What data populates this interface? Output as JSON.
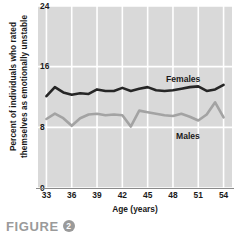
{
  "figure": {
    "caption_word": "FIGURE",
    "caption_number": "2"
  },
  "chart_data": {
    "type": "line",
    "title": "",
    "xlabel": "Age (years)",
    "ylabel": "Percent of individuals who rated\nthemselves as emotionally unstable",
    "xlim": [
      32,
      55
    ],
    "ylim": [
      0,
      24
    ],
    "yticks": [
      0,
      8,
      16,
      24
    ],
    "xticks": [
      33,
      36,
      39,
      42,
      45,
      48,
      51,
      54
    ],
    "grid": true,
    "legend_position": "inline-right",
    "x": [
      33,
      34,
      35,
      36,
      37,
      38,
      39,
      40,
      41,
      42,
      43,
      44,
      45,
      46,
      47,
      48,
      49,
      50,
      51,
      52,
      53,
      54
    ],
    "series": [
      {
        "name": "Females",
        "color": "#262626",
        "values": [
          12.1,
          13.3,
          12.6,
          12.3,
          12.5,
          12.4,
          13.0,
          12.8,
          12.8,
          13.2,
          12.8,
          13.1,
          13.3,
          12.9,
          12.8,
          12.9,
          13.1,
          13.3,
          13.4,
          12.8,
          13.0,
          13.6
        ]
      },
      {
        "name": "Males",
        "color": "#a3a3a3",
        "values": [
          9.1,
          9.8,
          9.2,
          8.2,
          9.2,
          9.7,
          9.8,
          9.6,
          9.7,
          9.6,
          8.1,
          10.2,
          10.0,
          9.8,
          9.6,
          9.5,
          9.8,
          9.4,
          8.9,
          9.7,
          11.3,
          9.3
        ]
      }
    ],
    "annotations": [
      {
        "text": "Females",
        "series": "Females"
      },
      {
        "text": "Males",
        "series": "Males"
      }
    ]
  },
  "colors": {
    "plot_background": "#d9d9d9",
    "gridline": "#ffffff",
    "axis": "#8a8a8a",
    "text": "#1a1a1a",
    "caption": "#9a9a9a"
  }
}
